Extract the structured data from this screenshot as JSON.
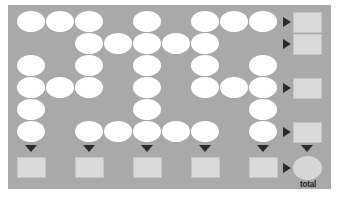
{
  "diagram": {
    "panel_color": "#a9a9a9",
    "oval_color": "#ffffff",
    "box_color": "#d9d9d9",
    "arrow_color": "#2b2b2b",
    "grid": {
      "columns": 9,
      "rows": 6,
      "origin_x": 17,
      "origin_y": 11,
      "step_x": 29,
      "step_y": 22,
      "filled_cells": [
        [
          0,
          1,
          2,
          4,
          6,
          7,
          8
        ],
        [
          2,
          3,
          4,
          5,
          6
        ],
        [
          0,
          2,
          4,
          6,
          8
        ],
        [
          0,
          1,
          2,
          4,
          6,
          7,
          8
        ],
        [
          0,
          4,
          8
        ],
        [
          0,
          2,
          3,
          4,
          5,
          6,
          8
        ]
      ]
    },
    "row_outputs": [
      0,
      1,
      3,
      5
    ],
    "column_outputs": [
      0,
      2,
      4,
      6,
      8
    ],
    "total": {
      "label": "total"
    }
  }
}
